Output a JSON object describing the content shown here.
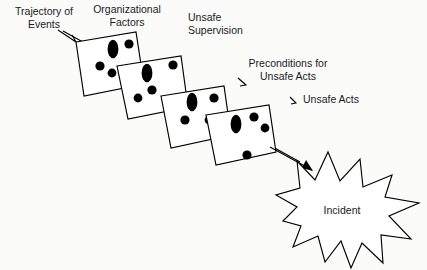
{
  "diagram": {
    "background_color": "#fbfbfa",
    "line_color": "#000000",
    "fill_color": "#ffffff",
    "labels": {
      "trajectory_line1": "Trajectory of",
      "trajectory_line2": "Events",
      "organizational_line1": "Organizational",
      "organizational_line2": "Factors",
      "supervision_line1": "Unsafe",
      "supervision_line2": "Supervision",
      "preconditions_line1": "Preconditions for",
      "preconditions_line2": "Unsafe Acts",
      "unsafe_acts": "Unsafe Acts",
      "incident": "Incident"
    },
    "layers": [
      {
        "id": "organizational-factors",
        "label": "Organizational Factors",
        "order": 1,
        "holes": 4
      },
      {
        "id": "unsafe-supervision",
        "label": "Unsafe Supervision",
        "order": 2,
        "holes": 4
      },
      {
        "id": "preconditions-for-unsafe-acts",
        "label": "Preconditions for Unsafe Acts",
        "order": 3,
        "holes": 4
      },
      {
        "id": "unsafe-acts",
        "label": "Unsafe Acts",
        "order": 4,
        "holes": 4
      }
    ],
    "outcome": {
      "id": "incident",
      "label": "Incident",
      "shape": "starburst"
    }
  }
}
